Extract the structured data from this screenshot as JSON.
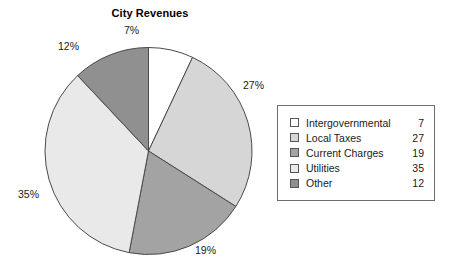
{
  "chart_data": {
    "type": "pie",
    "title": "City Revenues",
    "xlabel": "",
    "ylabel": "",
    "legend_position": "right",
    "grid": false,
    "categories": [
      "Intergovernmental",
      "Local Taxes",
      "Current Charges",
      "Utilities",
      "Other"
    ],
    "values": [
      7,
      27,
      19,
      35,
      12
    ],
    "slice_labels": [
      "7%",
      "27%",
      "19%",
      "35%",
      "12%"
    ],
    "slice_colors": [
      "#ffffff",
      "#d6d6d6",
      "#a3a3a3",
      "#e9e9e9",
      "#909090"
    ],
    "slice_order": "clockwise from 12 o'clock",
    "total": 100,
    "units": "percent"
  },
  "legend": {
    "rows": [
      {
        "label": "Intergovernmental",
        "value": "7",
        "color": "#ffffff"
      },
      {
        "label": "Local Taxes",
        "value": "27",
        "color": "#d6d6d6"
      },
      {
        "label": "Current Charges",
        "value": "19",
        "color": "#a3a3a3"
      },
      {
        "label": "Utilities",
        "value": "35",
        "color": "#e9e9e9"
      },
      {
        "label": "Other",
        "value": "12",
        "color": "#909090"
      }
    ]
  },
  "style": {
    "outline_color": "#4a4a4a",
    "legend_border_color": "#6e6e6e",
    "text_color": "#1a1a1a",
    "background": "#ffffff"
  }
}
